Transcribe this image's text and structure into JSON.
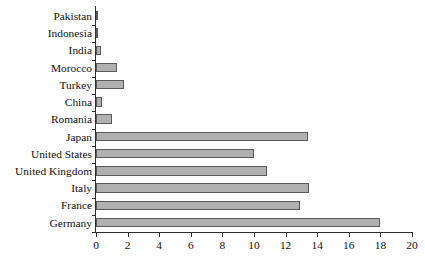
{
  "chart_data": {
    "type": "bar",
    "orientation": "horizontal",
    "title": "",
    "subtitle": "",
    "xlabel": "",
    "ylabel": "",
    "xlim": [
      0,
      20
    ],
    "xticks": [
      0,
      2,
      4,
      6,
      8,
      10,
      12,
      14,
      16,
      18,
      20
    ],
    "grid": false,
    "legend": false,
    "categories": [
      "Pakistan",
      "Indonesia",
      "India",
      "Morocco",
      "Turkey",
      "China",
      "Romania",
      "Japan",
      "United States",
      "United Kingdom",
      "Italy",
      "France",
      "Germany"
    ],
    "values": [
      0.15,
      0.15,
      0.3,
      1.3,
      1.8,
      0.35,
      1.0,
      13.4,
      10.0,
      10.8,
      13.5,
      12.9,
      18.0
    ],
    "bar_fill_color": "#b0b0b0",
    "bar_border_color": "#5a5a5a",
    "axis_color": "#2e2e2e",
    "background_color": "#ffffff"
  }
}
